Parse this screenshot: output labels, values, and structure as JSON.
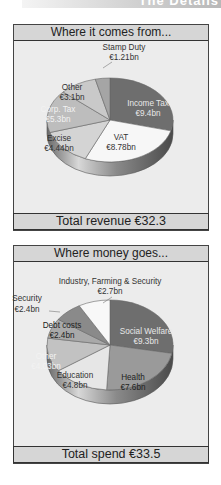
{
  "header": {
    "partial_title": "The Details"
  },
  "chart_data": [
    {
      "type": "pie",
      "title": "Where it comes from...",
      "total_label": "Total revenue €32.3",
      "unit": "€bn",
      "slices": [
        {
          "label": "Income Tax",
          "value_label": "€9.4bn",
          "value": 9.4,
          "color": "#6e6e6e",
          "text_color": "#e8e8e8"
        },
        {
          "label": "VAT",
          "value_label": "€8.78bn",
          "value": 8.78,
          "color": "#f7f7f7",
          "text_color": "#333333"
        },
        {
          "label": "Excise",
          "value_label": "€4.44bn",
          "value": 4.44,
          "color": "#d4d4d4",
          "text_color": "#333333"
        },
        {
          "label": "Corp. Tax",
          "value_label": "€5.3bn",
          "value": 5.3,
          "color": "#bdbdbd",
          "text_color": "#f2f2f2"
        },
        {
          "label": "Other",
          "value_label": "€3.1bn",
          "value": 3.1,
          "color": "#c9c9c9",
          "text_color": "#333333"
        },
        {
          "label": "Stamp Duty",
          "value_label": "€1.21bn",
          "value": 1.21,
          "color": "#a5a5a5",
          "text_color": "#333333"
        }
      ]
    },
    {
      "type": "pie",
      "title": "Where money goes...",
      "total_label": "Total spend €33.5",
      "unit": "€bn",
      "slices": [
        {
          "label": "Social Welfare",
          "value_label": "€9.3bn",
          "value": 9.3,
          "color": "#6e6e6e",
          "text_color": "#e8e8e8"
        },
        {
          "label": "Health",
          "value_label": "€7.6bn",
          "value": 7.6,
          "color": "#9a9a9a",
          "text_color": "#222222"
        },
        {
          "label": "Education",
          "value_label": "€4.8bn",
          "value": 4.8,
          "color": "#e6e6e6",
          "text_color": "#333333"
        },
        {
          "label": "Other",
          "value_label": "€4.03bn",
          "value": 4.03,
          "color": "#c2c2c2",
          "text_color": "#f2f2f2"
        },
        {
          "label": "Debt costs",
          "value_label": "€2.4bn",
          "value": 2.4,
          "color": "#a9a9a9",
          "text_color": "#222222"
        },
        {
          "label": "Security",
          "value_label": "€2.4bn",
          "value": 2.4,
          "color": "#8a8a8a",
          "text_color": "#333333"
        },
        {
          "label": "Industry, Farming & Security",
          "value_label": "€2.7bn",
          "value": 2.7,
          "color": "#f8f8f8",
          "text_color": "#333333"
        }
      ]
    }
  ]
}
